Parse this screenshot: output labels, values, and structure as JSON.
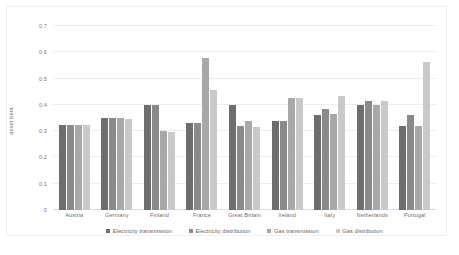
{
  "chart_data": {
    "type": "bar",
    "title": "",
    "xlabel": "",
    "ylabel": "asset beta",
    "ylim": [
      0,
      0.7
    ],
    "ytick_values": [
      0,
      0.1,
      0.2,
      0.3,
      0.4,
      0.5,
      0.6,
      0.7
    ],
    "ytick_labels": [
      "0",
      "0.1",
      "0.2",
      "0.3",
      "0.4",
      "0.5",
      "0.6",
      "0.7"
    ],
    "grid": true,
    "legend_position": "bottom",
    "categories": [
      "Austria",
      "Germany",
      "Finland",
      "France",
      "Great Britain",
      "Ireland",
      "Italy",
      "Netherlands",
      "Portugal"
    ],
    "series": [
      {
        "name": "Electricity transmission",
        "color": "#6e6e6e",
        "values": [
          0.323,
          0.35,
          0.4,
          0.33,
          0.4,
          0.34,
          0.36,
          0.4,
          0.318
        ]
      },
      {
        "name": "Electricity distribution",
        "color": "#8a8a8a",
        "values": [
          0.323,
          0.35,
          0.4,
          0.33,
          0.318,
          0.34,
          0.385,
          0.415,
          0.36
        ]
      },
      {
        "name": "Gas transmission",
        "color": "#a8a8a8",
        "values": [
          0.323,
          0.35,
          0.302,
          0.58,
          0.34,
          0.425,
          0.365,
          0.4,
          0.318
        ]
      },
      {
        "name": "Gas distribution",
        "color": "#c9c9c9",
        "values": [
          0.323,
          0.348,
          0.298,
          0.455,
          0.317,
          0.425,
          0.435,
          0.415,
          0.565
        ]
      }
    ]
  }
}
